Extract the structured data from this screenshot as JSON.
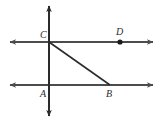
{
  "figure": {
    "type": "geometry-diagram",
    "background_color": "#ffffff",
    "canvas": {
      "width": 163,
      "height": 122
    }
  },
  "style": {
    "line_color": "#4c4c4c",
    "segment_color": "#2b2b2b",
    "vertical_color": "#2b2b2b",
    "point_color": "#1a1a1a",
    "label_color": "#2b2b2b",
    "line_width": 2,
    "segment_width": 1.6,
    "label_font_size": 10
  },
  "points": [
    {
      "id": "C",
      "label": "C",
      "x": 49,
      "y": 42,
      "dot": false,
      "label_x": 40,
      "label_y": 38
    },
    {
      "id": "D",
      "label": "D",
      "x": 120,
      "y": 42,
      "dot": true,
      "label_x": 116,
      "label_y": 35
    },
    {
      "id": "A",
      "label": "A",
      "x": 49,
      "y": 85,
      "dot": false,
      "label_x": 40,
      "label_y": 97
    },
    {
      "id": "B",
      "label": "B",
      "x": 110,
      "y": 85,
      "dot": false,
      "label_x": 106,
      "label_y": 97
    }
  ],
  "lines": [
    {
      "id": "upper-horizontal-line",
      "name": "line-through-C-and-D",
      "x1": 10,
      "y1": 42,
      "x2": 153,
      "y2": 42,
      "arrow_start": true,
      "arrow_end": true,
      "color": "#4c4c4c"
    },
    {
      "id": "lower-horizontal-line",
      "name": "line-through-A-and-B",
      "x1": 10,
      "y1": 85,
      "x2": 153,
      "y2": 85,
      "arrow_start": true,
      "arrow_end": true,
      "color": "#4c4c4c"
    },
    {
      "id": "vertical-transversal",
      "name": "line-through-C-and-A",
      "x1": 49,
      "y1": 6,
      "x2": 49,
      "y2": 116,
      "arrow_start": true,
      "arrow_end": true,
      "color": "#2b2b2b"
    }
  ],
  "segments": [
    {
      "id": "segment-CB",
      "name": "segment-from-C-to-B",
      "x1": 49,
      "y1": 42,
      "x2": 110,
      "y2": 85,
      "color": "#2b2b2b"
    }
  ],
  "labels": {
    "C": "C",
    "D": "D",
    "A": "A",
    "B": "B"
  }
}
